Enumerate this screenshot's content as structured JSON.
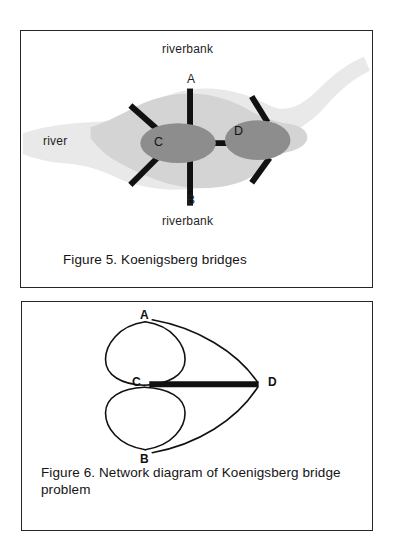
{
  "document": {
    "background_color": "#ffffff",
    "figures": [
      {
        "id": "figure-5",
        "caption": "Figure 5.  Koenigsberg bridges",
        "frame_color": "#262626",
        "map": {
          "river_fill": "#e8e8e8",
          "island_fill": "#d3d3d3",
          "node_fill": "#8f8f8f",
          "bridge_color": "#111111",
          "labels": {
            "riverbank_top": "riverbank",
            "riverbank_bottom": "riverbank",
            "river": "river",
            "landmass_a": "A",
            "landmass_b": "B",
            "island_c": "C",
            "island_d": "D"
          },
          "bridges": [
            {
              "name": "A-C upper",
              "from": "A",
              "to": "C"
            },
            {
              "name": "A-C upper-left",
              "from": "A",
              "to": "C"
            },
            {
              "name": "B-C lower",
              "from": "B",
              "to": "C"
            },
            {
              "name": "B-C lower-left",
              "from": "B",
              "to": "C"
            },
            {
              "name": "C-D middle",
              "from": "C",
              "to": "D"
            },
            {
              "name": "A-D upper-right",
              "from": "A",
              "to": "D"
            },
            {
              "name": "B-D lower-right",
              "from": "B",
              "to": "D"
            }
          ],
          "bridge_count": 7
        }
      },
      {
        "id": "figure-6",
        "caption": "Figure 6.  Network diagram of Koenigsberg bridge problem",
        "frame_color": "#262626",
        "network": {
          "line_color": "#111111",
          "nodes": [
            {
              "label": "A",
              "x": 145,
              "y": 319
            },
            {
              "label": "B",
              "x": 145,
              "y": 452
            },
            {
              "label": "C",
              "x": 144,
              "y": 384
            },
            {
              "label": "D",
              "x": 258,
              "y": 384
            }
          ],
          "edges": [
            {
              "from": "A",
              "to": "C",
              "style": "arc-left",
              "weight": "thin"
            },
            {
              "from": "A",
              "to": "C",
              "style": "arc-right",
              "weight": "thin"
            },
            {
              "from": "B",
              "to": "C",
              "style": "arc-left",
              "weight": "thin"
            },
            {
              "from": "B",
              "to": "C",
              "style": "arc-right",
              "weight": "thin"
            },
            {
              "from": "A",
              "to": "D",
              "style": "arc-outer",
              "weight": "thin"
            },
            {
              "from": "B",
              "to": "D",
              "style": "arc-outer",
              "weight": "thin"
            },
            {
              "from": "C",
              "to": "D",
              "style": "straight",
              "weight": "thick"
            }
          ],
          "edge_count": 7,
          "node_degrees": {
            "A": 3,
            "B": 3,
            "C": 5,
            "D": 3
          }
        }
      }
    ]
  }
}
